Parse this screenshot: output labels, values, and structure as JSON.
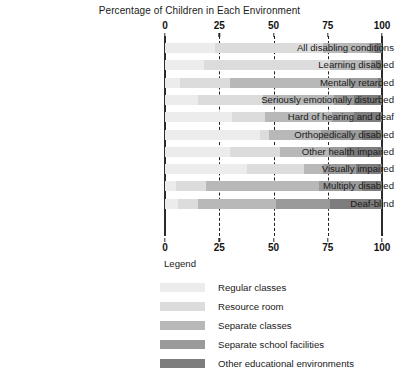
{
  "chart_data": {
    "type": "bar",
    "orientation": "horizontal",
    "stacked": true,
    "stack_mode": "percent",
    "title": "Percentage of Children in Each Environment",
    "xlabel": "",
    "ylabel": "",
    "xlim": [
      0,
      100
    ],
    "xticks": [
      0,
      25,
      50,
      75,
      100
    ],
    "xtick_labels": [
      "0",
      "25",
      "50",
      "75",
      "100"
    ],
    "grid": true,
    "grid_style": "dashed-vertical",
    "axis_duplicated_top_and_bottom": true,
    "legend_position": "below-right",
    "legend_title": "Legend",
    "categories": [
      "All disabling conditions",
      "Learning disabled",
      "Mentally retarded",
      "Seriously emotionally disturbed",
      "Hard of hearing and deaf",
      "Orthopedically disabled",
      "Other health impaired",
      "Visually impaired",
      "Multiply disabled",
      "Deaf-blind"
    ],
    "series": [
      {
        "name": "Regular classes",
        "color": "#ececec",
        "values": [
          23,
          18,
          7,
          15,
          31,
          44,
          30,
          38,
          5,
          6
        ]
      },
      {
        "name": "Resource room",
        "color": "#dcdcdc",
        "values": [
          50,
          58,
          23,
          30,
          15,
          4,
          23,
          26,
          14,
          9
        ]
      },
      {
        "name": "Separate classes",
        "color": "#b8b8b8",
        "values": [
          21,
          19,
          55,
          33,
          31,
          24,
          23,
          9,
          52,
          36
        ]
      },
      {
        "name": "Separate school facilities",
        "color": "#9a9a9a",
        "values": [
          3,
          3,
          13,
          9,
          10,
          19,
          8,
          15,
          20,
          25
        ]
      },
      {
        "name": "Other educational environments",
        "color": "#7d7d7d",
        "values": [
          3,
          2,
          2,
          13,
          13,
          9,
          16,
          12,
          9,
          24
        ]
      }
    ]
  },
  "colors": {
    "axis": "#2b2b2b",
    "text": "#1a1a1a",
    "background": "#ffffff"
  }
}
